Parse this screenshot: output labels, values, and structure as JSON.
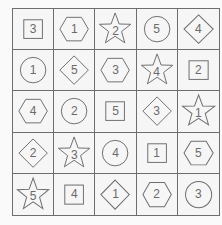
{
  "puzzle": {
    "rows": 5,
    "cols": 5,
    "line_color": "#6e6e6e",
    "cells": [
      [
        {
          "shape": "square",
          "value": "3"
        },
        {
          "shape": "hexagon",
          "value": "1"
        },
        {
          "shape": "star",
          "value": "2"
        },
        {
          "shape": "circle",
          "value": "5"
        },
        {
          "shape": "diamond",
          "value": "4"
        }
      ],
      [
        {
          "shape": "circle",
          "value": "1"
        },
        {
          "shape": "diamond",
          "value": "5"
        },
        {
          "shape": "hexagon",
          "value": "3"
        },
        {
          "shape": "star",
          "value": "4"
        },
        {
          "shape": "square",
          "value": "2"
        }
      ],
      [
        {
          "shape": "hexagon",
          "value": "4"
        },
        {
          "shape": "circle",
          "value": "2"
        },
        {
          "shape": "square",
          "value": "5"
        },
        {
          "shape": "diamond",
          "value": "3"
        },
        {
          "shape": "star",
          "value": "1"
        }
      ],
      [
        {
          "shape": "diamond",
          "value": "2"
        },
        {
          "shape": "star",
          "value": "3"
        },
        {
          "shape": "circle",
          "value": "4"
        },
        {
          "shape": "square",
          "value": "1"
        },
        {
          "shape": "hexagon",
          "value": "5"
        }
      ],
      [
        {
          "shape": "star",
          "value": "5"
        },
        {
          "shape": "square",
          "value": "4"
        },
        {
          "shape": "diamond",
          "value": "1"
        },
        {
          "shape": "hexagon",
          "value": "2"
        },
        {
          "shape": "circle",
          "value": "3"
        }
      ]
    ]
  }
}
